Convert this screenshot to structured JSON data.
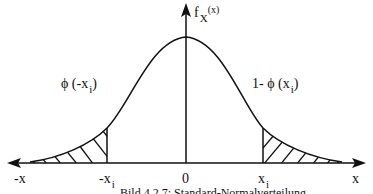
{
  "diagram": {
    "y_axis_label": {
      "main": "f",
      "sub": "X",
      "sup": "(x)"
    },
    "x_axis_label_right": "x",
    "x_axis_label_left": "-x",
    "ticks": {
      "neg_xi": {
        "main": "-x",
        "sub": "i"
      },
      "zero": "0",
      "pos_xi": {
        "main": "x",
        "sub": "i"
      }
    },
    "left_area_label": {
      "prefix": "ϕ (-x",
      "sub": "i",
      "suffix": ")"
    },
    "right_area_label": {
      "prefix": "1- ϕ (x",
      "sub": "i",
      "suffix": ")"
    },
    "caption": "Bild 4.2.7: Standard-Normalverteilung",
    "colors": {
      "line": "#111111",
      "background": "#ffffff"
    }
  }
}
